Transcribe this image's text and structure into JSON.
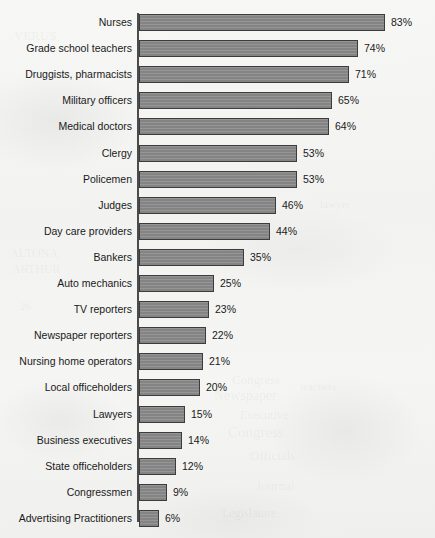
{
  "document": {
    "background_color": "#f4f4f2",
    "title_cut_off": true,
    "title_note": "Chart title is cropped off the top edge of the scan and is not legible"
  },
  "axis": {
    "color": "#4c4c4c",
    "orientation": "vertical-category-axis"
  },
  "style": {
    "bar_fill": "#8a8a8a",
    "bar_border": "#3c3c3c",
    "text_color": "#1a1a1a"
  },
  "ghost_text": [
    {
      "text": "VERUS",
      "x": 14,
      "y": 28,
      "size": 13
    },
    {
      "text": "ALTONA",
      "x": 10,
      "y": 246,
      "size": 12
    },
    {
      "text": "ARTHUR",
      "x": 12,
      "y": 262,
      "size": 12
    },
    {
      "text": "26",
      "x": 20,
      "y": 300,
      "size": 11
    },
    {
      "text": "Congress",
      "x": 232,
      "y": 372,
      "size": 13
    },
    {
      "text": "Newspaper",
      "x": 214,
      "y": 388,
      "size": 14
    },
    {
      "text": "Executive",
      "x": 240,
      "y": 408,
      "size": 12
    },
    {
      "text": "Congress",
      "x": 228,
      "y": 424,
      "size": 15
    },
    {
      "text": "Officials",
      "x": 250,
      "y": 448,
      "size": 13
    },
    {
      "text": "Journal",
      "x": 256,
      "y": 478,
      "size": 13
    },
    {
      "text": "Legislature",
      "x": 222,
      "y": 506,
      "size": 12
    },
    {
      "text": "lawyer",
      "x": 320,
      "y": 198,
      "size": 11
    },
    {
      "text": "teachers",
      "x": 300,
      "y": 380,
      "size": 11
    }
  ],
  "chart_data": {
    "type": "bar",
    "orientation": "horizontal",
    "title": "",
    "xlabel": "",
    "ylabel": "",
    "xlim": [
      0,
      83
    ],
    "grid": false,
    "legend": false,
    "value_suffix": "%",
    "categories": [
      "Nurses",
      "Grade school teachers",
      "Druggists, pharmacists",
      "Military officers",
      "Medical doctors",
      "Clergy",
      "Policemen",
      "Judges",
      "Day care providers",
      "Bankers",
      "Auto mechanics",
      "TV reporters",
      "Newspaper reporters",
      "Nursing home operators",
      "Local officeholders",
      "Lawyers",
      "Business executives",
      "State officeholders",
      "Congressmen",
      "Advertising Practitioners"
    ],
    "values": [
      83,
      74,
      71,
      65,
      64,
      53,
      53,
      46,
      44,
      35,
      25,
      23,
      22,
      21,
      20,
      15,
      14,
      12,
      9,
      6
    ],
    "value_labels": [
      "83%",
      "74%",
      "71%",
      "65%",
      "64%",
      "53%",
      "53%",
      "46%",
      "44%",
      "35%",
      "25%",
      "23%",
      "22%",
      "21%",
      "20%",
      "15%",
      "14%",
      "12%",
      "9%",
      "6%"
    ]
  }
}
